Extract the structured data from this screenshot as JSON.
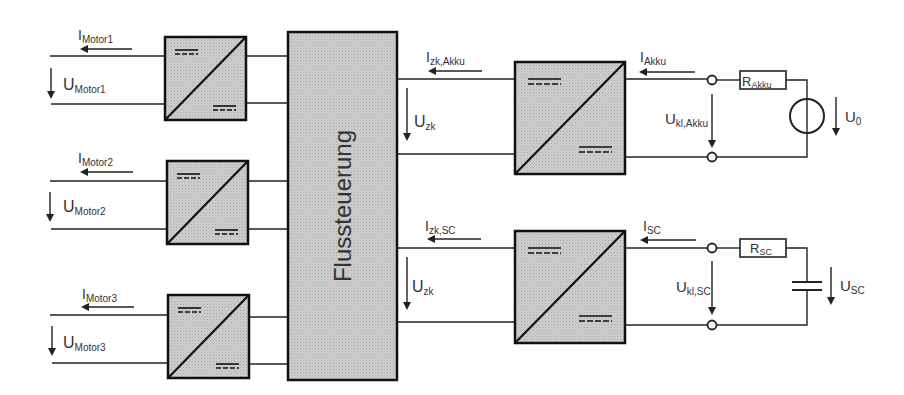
{
  "diagram": {
    "type": "block-diagram",
    "central_block": {
      "label": "Flussteuerung"
    },
    "motors": [
      {
        "current_label": "I",
        "current_sub": "Motor1",
        "voltage_label": "U",
        "voltage_sub": "Motor1"
      },
      {
        "current_label": "I",
        "current_sub": "Motor2",
        "voltage_label": "U",
        "voltage_sub": "Motor2"
      },
      {
        "current_label": "I",
        "current_sub": "Motor3",
        "voltage_label": "U",
        "voltage_sub": "Motor3"
      }
    ],
    "akku_branch": {
      "dc_link_current": {
        "main": "I",
        "sub": "zk,Akku"
      },
      "dc_link_voltage": {
        "main": "U",
        "sub": "zk"
      },
      "source_current": {
        "main": "I",
        "sub": "Akku"
      },
      "terminal_voltage": {
        "main": "U",
        "sub": "kl,Akku"
      },
      "resistor": {
        "main": "R",
        "sub": "Akku"
      },
      "source_voltage": {
        "main": "U",
        "sub": "0"
      }
    },
    "sc_branch": {
      "dc_link_current": {
        "main": "I",
        "sub": "zk,SC"
      },
      "dc_link_voltage": {
        "main": "U",
        "sub": "zk"
      },
      "source_current": {
        "main": "I",
        "sub": "SC"
      },
      "terminal_voltage": {
        "main": "U",
        "sub": "kl,SC"
      },
      "resistor": {
        "main": "R",
        "sub": "SC"
      },
      "capacitor_voltage": {
        "main": "U",
        "sub": "SC"
      }
    },
    "colors": {
      "block_fill": "#c8c8c8",
      "line": "#222222",
      "text": "#333333",
      "background": "#ffffff"
    }
  }
}
